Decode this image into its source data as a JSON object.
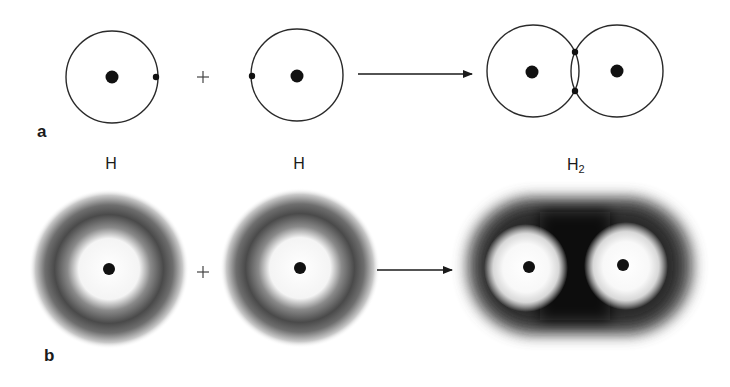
{
  "figure": {
    "background": "#ffffff",
    "ink_color": "#1a1a1a",
    "panel_a": {
      "label": "a",
      "reactants": [
        {
          "name": "hydrogen-atom-1",
          "nucleus": [
            112,
            77
          ],
          "orbit_radius": 46,
          "electron": [
            156,
            77
          ]
        },
        {
          "name": "hydrogen-atom-2",
          "nucleus": [
            297,
            76
          ],
          "orbit_radius": 46,
          "electron": [
            252,
            76
          ]
        }
      ],
      "operator": "+",
      "product": {
        "name": "hydrogen-molecule",
        "nuclei": [
          [
            533,
            72
          ],
          [
            617,
            71
          ]
        ],
        "orbit_radius": 46,
        "shared_electrons": [
          [
            575,
            52
          ],
          [
            575,
            91
          ]
        ]
      }
    },
    "panel_b": {
      "label": "b",
      "reactants": [
        {
          "label": "H",
          "nucleus": [
            109,
            269
          ]
        },
        {
          "label": "H",
          "nucleus": [
            300,
            268
          ]
        }
      ],
      "operator": "+",
      "product": {
        "label": "H",
        "label_subscript": "2",
        "nuclei": [
          [
            529,
            267
          ],
          [
            623,
            265
          ]
        ]
      }
    }
  }
}
